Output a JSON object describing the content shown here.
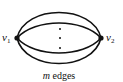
{
  "diagram": {
    "type": "multigraph",
    "vertices": [
      {
        "id": "v1",
        "label_base": "v",
        "label_sub": "1",
        "x": 17,
        "y": 38
      },
      {
        "id": "v2",
        "label_base": "v",
        "label_sub": "2",
        "x": 101,
        "y": 38
      }
    ],
    "edges_caption_var": "m",
    "edges_caption_text": " edges",
    "ellipsis": "vertical dots",
    "colors": {
      "stroke": "#111111",
      "background": "#ffffff"
    }
  }
}
